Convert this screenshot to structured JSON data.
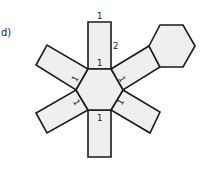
{
  "figure": {
    "label": "d)",
    "colors": {
      "fill": "#efefef",
      "stroke": "#1a1a1a"
    },
    "edge_labels": {
      "top_rect_top": "1",
      "top_rect_side": "2",
      "center_top": "1",
      "center_bottom": "1",
      "center_upper_left": "1",
      "center_upper_right": "1",
      "center_lower_left": "1",
      "center_lower_right": "1"
    }
  }
}
